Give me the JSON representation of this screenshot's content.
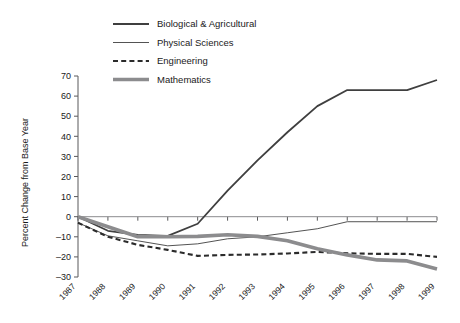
{
  "chart_data": {
    "type": "line",
    "title": "",
    "xlabel": "",
    "ylabel": "Percent Change from Base Year",
    "x": [
      1987,
      1988,
      1989,
      1990,
      1991,
      1992,
      1993,
      1994,
      1995,
      1996,
      1997,
      1998,
      1999
    ],
    "categories": [
      "1987",
      "1988",
      "1989",
      "1990",
      "1991",
      "1992",
      "1993",
      "1994",
      "1995",
      "1996",
      "1997",
      "1998",
      "1999"
    ],
    "xlim": [
      1987,
      1999
    ],
    "ylim": [
      -30,
      70
    ],
    "yticks": [
      -30,
      -20,
      -10,
      0,
      10,
      20,
      30,
      40,
      50,
      60,
      70
    ],
    "ytick_labels": [
      "–30",
      "–20",
      "–10",
      "0",
      "10",
      "20",
      "30",
      "40",
      "50",
      "60",
      "70"
    ],
    "grid": false,
    "legend_position": "top-center",
    "zero_reference_line": true,
    "series": [
      {
        "name": "Biological & Agricultural",
        "style": "solid",
        "width": 1.8,
        "color": "#3f3f3f",
        "values": [
          0,
          -7,
          -9,
          -9.5,
          -3.5,
          13,
          28,
          42,
          55,
          63,
          63,
          63,
          68
        ]
      },
      {
        "name": "Physical Sciences",
        "style": "solid",
        "width": 0.9,
        "color": "#3f3f3f",
        "values": [
          -3,
          -9.5,
          -12,
          -14.5,
          -13.5,
          -11,
          -10,
          -8,
          -6,
          -2.5,
          -2.5,
          -2.5,
          -2.5
        ]
      },
      {
        "name": "Engineering",
        "style": "dashed",
        "width": 2.1,
        "color": "#2b2b2b",
        "values": [
          -3,
          -10,
          -14,
          -16.5,
          -19.5,
          -19,
          -18.8,
          -18.3,
          -17.5,
          -18.2,
          -18.5,
          -18.5,
          -20
        ]
      },
      {
        "name": "Mathematics",
        "style": "solid",
        "width": 3.6,
        "color": "#8c8c8e",
        "values": [
          0,
          -5,
          -10,
          -10,
          -9.8,
          -9,
          -9.8,
          -12,
          -16,
          -19,
          -21.5,
          -22,
          -26
        ]
      }
    ]
  },
  "legend": {
    "items": [
      {
        "label": "Biological & Agricultural"
      },
      {
        "label": "Physical Sciences"
      },
      {
        "label": "Engineering"
      },
      {
        "label": "Mathematics"
      }
    ]
  },
  "axes": {
    "y_title": "Percent Change from Base Year"
  }
}
